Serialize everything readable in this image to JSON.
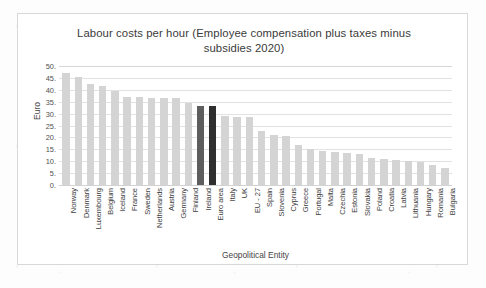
{
  "chart_data": {
    "type": "bar",
    "title": "Labour costs per hour (Employee compensation plus taxes minus subsidies 2020)",
    "xlabel": "Geopolitical Entity",
    "ylabel": "Euro",
    "ylim": [
      0,
      50
    ],
    "ytick_labels": [
      "50.",
      "45.",
      "40.",
      "35.",
      "30.",
      "25.",
      "20.",
      "15.",
      "10.",
      "5.",
      "0."
    ],
    "ytick_values": [
      50,
      45,
      40,
      35,
      30,
      25,
      20,
      15,
      10,
      5,
      0
    ],
    "grid": true,
    "legend": "none",
    "categories": [
      "Norway",
      "Denmark",
      "Luxembourg",
      "Belgium",
      "Iceland",
      "France",
      "Sweden",
      "Netherlands",
      "Austria",
      "Germany",
      "Finland",
      "Ireland",
      "Euro area",
      "Italy",
      "UK",
      "EU - 27",
      "Spain",
      "Slovenia",
      "Cyprus",
      "Greece",
      "Portugal",
      "Malta",
      "Czechia",
      "Estonia",
      "Slovakia",
      "Poland",
      "Croatia",
      "Latvia",
      "Lithuania",
      "Hungary",
      "Romania",
      "Bulgaria"
    ],
    "values": [
      47.0,
      45.5,
      42.5,
      41.5,
      39.5,
      37.0,
      37.0,
      36.5,
      36.5,
      36.5,
      34.5,
      33.0,
      33.0,
      29.0,
      28.5,
      28.5,
      22.5,
      21.0,
      20.5,
      17.0,
      15.0,
      14.5,
      14.0,
      13.5,
      13.0,
      11.5,
      11.0,
      10.5,
      10.0,
      9.5,
      8.5,
      7.0
    ],
    "highlighted": [
      "Ireland",
      "Euro area"
    ],
    "colors": {
      "bar": "#d4d4d4",
      "highlight_ireland": "#5e5e5e",
      "highlight_euro_area": "#2f2f2f",
      "gridline": "#e2e2e2",
      "text": "#3d3d3d"
    }
  }
}
